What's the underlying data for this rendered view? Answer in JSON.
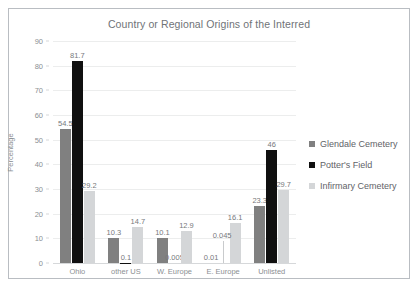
{
  "chart_data": {
    "type": "bar",
    "title": "Country or Regional Origins of the Interred",
    "xlabel": "",
    "ylabel": "Percentage",
    "ylim": [
      0,
      90
    ],
    "ytick_step": 10,
    "yticks": [
      0,
      10,
      20,
      30,
      40,
      50,
      60,
      70,
      80,
      90
    ],
    "grid": true,
    "legend_position": "right",
    "categories": [
      "Ohio",
      "other US",
      "W. Europe",
      "E. Europe",
      "Unlisted"
    ],
    "series": [
      {
        "name": "Glendale Cemetery",
        "color": "#808080",
        "values": [
          54.5,
          10.3,
          10.1,
          0.01,
          23.3
        ],
        "labels": [
          "54.5",
          "10.3",
          "10.1",
          "0.01",
          "23.3"
        ]
      },
      {
        "name": "Potter's Field",
        "color": "#101010",
        "values": [
          81.7,
          0.1,
          0.005,
          0,
          46
        ],
        "labels": [
          "81.7",
          "0.1",
          "0.005",
          "",
          "46"
        ]
      },
      {
        "name": "Infirmary Cemetery",
        "color": "#d4d6d8",
        "values": [
          29.2,
          14.7,
          12.9,
          16.1,
          29.7
        ],
        "labels": [
          "29.2",
          "14.7",
          "12.9",
          "16.1",
          "29.7"
        ]
      }
    ],
    "extra_annotations": [
      {
        "text": "0.045",
        "category": "E. Europe",
        "note": "label above near-zero Potter's Field bar"
      }
    ]
  }
}
